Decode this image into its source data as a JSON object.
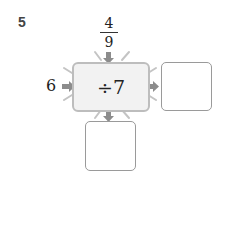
{
  "problem_number": "5",
  "top_input": {
    "numerator": "4",
    "denominator": "9"
  },
  "left_input": "6",
  "operation": "÷7",
  "outputs": {
    "right_answer": "",
    "bottom_answer": ""
  },
  "colors": {
    "arrow": "#8c8c8c",
    "machine_fill": "#f2f2f2",
    "machine_border": "#bdbdbd",
    "box_border": "#9a9a9a"
  }
}
